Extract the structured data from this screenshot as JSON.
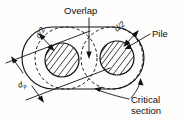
{
  "figure": {
    "background_color": "#fdfdfc",
    "line_color": "#121212"
  },
  "labels": {
    "overlap": "Overlap",
    "pile": "Pile",
    "critical_line1": "Critical",
    "critical_line2": "section",
    "d_over_2_left": "d/2",
    "d_over_2_right": "d/2",
    "pile_diameter_symbol": "d",
    "pile_diameter_subscript": "p"
  },
  "geometry": {
    "stadium": {
      "left": 22,
      "top": 27,
      "width": 122,
      "height": 62,
      "corner_radius": 31
    },
    "dashed_circles": [
      {
        "cx": 66,
        "cy": 58,
        "r": 31
      },
      {
        "cx": 112,
        "cy": 58,
        "r": 31
      }
    ],
    "piles": [
      {
        "cx": 62,
        "cy": 60,
        "r": 17
      },
      {
        "cx": 117,
        "cy": 58,
        "r": 17
      }
    ],
    "overlap_region": "lens formed by intersection of the two dashed circles"
  },
  "icons": {
    "arrowhead": "arrowhead-icon",
    "dimension_arrow": "dimension-arrow-icon",
    "hatch": "hatch-fill-icon"
  }
}
